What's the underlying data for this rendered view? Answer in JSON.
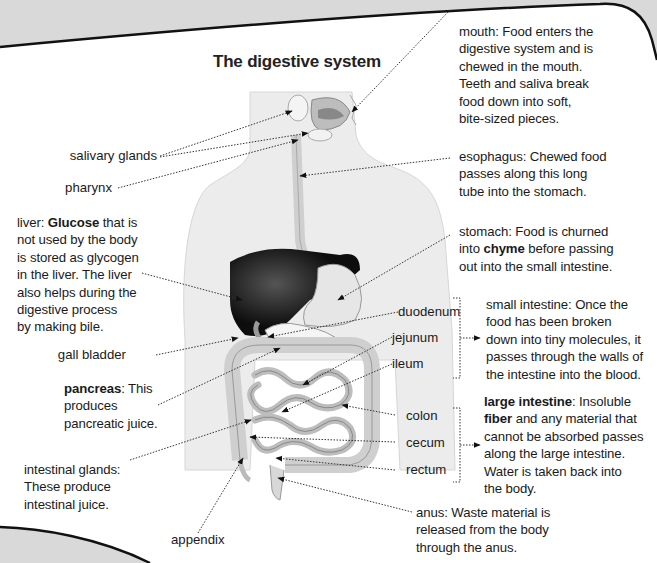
{
  "title": "The digestive system",
  "colors": {
    "page_bg": "#ffffff",
    "outer_bg": "#d9d9d9",
    "text": "#1a1a1a",
    "body_silhouette": "#ececec",
    "organ_light": "#e4e4e4",
    "liver": "#0d0d0d"
  },
  "left_labels": {
    "salivary_glands": "salivary glands",
    "pharynx": "pharynx",
    "liver": {
      "term": "liver:",
      "bold": "Glucose",
      "rest1": " that is",
      "lines": [
        "not used by the body",
        "is stored as glycogen",
        "in the liver. The liver",
        "also helps during the",
        "digestive process",
        "by making bile."
      ]
    },
    "gall_bladder": "gall bladder",
    "pancreas": {
      "bold": "pancreas",
      "rest1": ": This",
      "lines": [
        "produces",
        "pancreatic juice."
      ]
    },
    "intestinal_glands": {
      "lines": [
        "intestinal glands:",
        "These produce",
        "intestinal juice."
      ]
    },
    "appendix": "appendix"
  },
  "middle_labels": {
    "duodenum": "duodenum",
    "jejunum": "jejunum",
    "ileum": "ileum",
    "colon": "colon",
    "cecum": "cecum",
    "rectum": "rectum"
  },
  "right_labels": {
    "mouth": {
      "lines": [
        "mouth: Food enters the",
        "digestive system and is",
        "chewed in the mouth.",
        "Teeth and saliva break",
        "food down into soft,",
        "bite-sized pieces."
      ]
    },
    "esophagus": {
      "lines": [
        "esophagus: Chewed food",
        "passes along this long",
        "tube into the stomach."
      ]
    },
    "stomach": {
      "line1": "stomach: Food is churned",
      "line2_pre": "into ",
      "line2_bold": "chyme",
      "line2_post": " before passing",
      "line3": "out into the small intestine."
    },
    "small_intestine": {
      "lines": [
        "small intestine: Once the",
        "food has been broken",
        "down into tiny molecules, it",
        "passes through the walls of",
        "the intestine into the blood."
      ]
    },
    "large_intestine": {
      "bold1": "large intestine",
      "rest1": ": Insoluble",
      "bold2": "fiber",
      "rest2": " and any material that",
      "lines": [
        "cannot be absorbed passes",
        "along the large intestine.",
        "Water is taken back into",
        "the body."
      ]
    },
    "anus": {
      "lines": [
        "anus: Waste material is",
        "released from the body",
        "through the anus."
      ]
    }
  }
}
